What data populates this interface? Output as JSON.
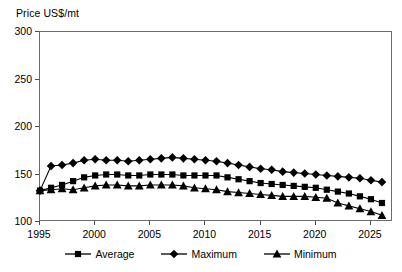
{
  "chart_data": {
    "type": "line",
    "title": "Price US$/mt",
    "ylabel": "Price US$/mt",
    "xlabel": "",
    "ylim": [
      100,
      300
    ],
    "xlim": [
      1995,
      2027
    ],
    "yticks": [
      100,
      150,
      200,
      250,
      300
    ],
    "xticks": [
      1995,
      2000,
      2005,
      2010,
      2015,
      2020,
      2025
    ],
    "grid": false,
    "legend_position": "bottom",
    "x": [
      1995,
      1996,
      1997,
      1998,
      1999,
      2000,
      2001,
      2002,
      2003,
      2004,
      2005,
      2006,
      2007,
      2008,
      2009,
      2010,
      2011,
      2012,
      2013,
      2014,
      2015,
      2016,
      2017,
      2018,
      2019,
      2020,
      2021,
      2022,
      2023,
      2024,
      2025,
      2026
    ],
    "series": [
      {
        "name": "Average",
        "marker": "square",
        "values": [
          133,
          136,
          139,
          143,
          147,
          149,
          150,
          150,
          149,
          149,
          150,
          150,
          150,
          149,
          149,
          149,
          149,
          147,
          145,
          143,
          141,
          140,
          139,
          138,
          137,
          136,
          134,
          132,
          130,
          127,
          124,
          120
        ]
      },
      {
        "name": "Maximum",
        "marker": "diamond",
        "values": [
          133,
          159,
          160,
          162,
          165,
          166,
          165,
          165,
          164,
          165,
          166,
          167,
          168,
          167,
          166,
          165,
          164,
          162,
          160,
          158,
          156,
          155,
          153,
          152,
          151,
          150,
          149,
          148,
          147,
          146,
          144,
          142
        ]
      },
      {
        "name": "Minimum",
        "marker": "triangle",
        "values": [
          133,
          134,
          135,
          134,
          136,
          138,
          139,
          139,
          138,
          138,
          139,
          139,
          139,
          138,
          136,
          135,
          134,
          132,
          131,
          130,
          129,
          128,
          127,
          127,
          127,
          126,
          125,
          120,
          117,
          114,
          111,
          107
        ]
      }
    ]
  },
  "legend": {
    "items": [
      {
        "label": "Average"
      },
      {
        "label": "Maximum"
      },
      {
        "label": "Minimum"
      }
    ]
  },
  "colors": {
    "series": "#000000",
    "frame": "#6b6b6b",
    "background": "#ffffff"
  }
}
